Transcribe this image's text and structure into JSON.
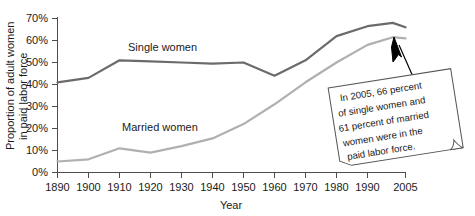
{
  "chart_data": {
    "type": "line",
    "title": "",
    "xlabel": "Year",
    "ylabel": "Proportion of adult women in paid labor force",
    "ylabel_line1": "Proportion of adult women",
    "ylabel_line2": "in paid labor force",
    "x": [
      1890,
      1900,
      1910,
      1920,
      1930,
      1940,
      1950,
      1960,
      1970,
      1980,
      1990,
      2000,
      2005
    ],
    "xticks": [
      "1890",
      "1900",
      "1910",
      "1920",
      "1930",
      "1940",
      "1950",
      "1960",
      "1970",
      "1980",
      "1990",
      "2005"
    ],
    "xtick_values": [
      1890,
      1900,
      1910,
      1920,
      1930,
      1940,
      1950,
      1960,
      1970,
      1980,
      1990,
      2005
    ],
    "yticks": [
      "0%",
      "10%",
      "20%",
      "30%",
      "40%",
      "50%",
      "60%",
      "70%"
    ],
    "ytick_values": [
      0,
      10,
      20,
      30,
      40,
      50,
      60,
      70
    ],
    "ylim": [
      0,
      70
    ],
    "xlim": [
      1890,
      2005
    ],
    "grid": false,
    "legend_position": "inline-labels",
    "series": [
      {
        "name": "Single women",
        "color": "#6b6b6b",
        "label_x": 1925,
        "label_y": 58,
        "values": [
          41,
          43,
          51,
          50.5,
          50,
          49.5,
          50,
          44,
          51,
          62,
          66.5,
          68,
          66
        ]
      },
      {
        "name": "Married women",
        "color": "#b0b0b0",
        "label_x": 1925,
        "label_y": 28,
        "values": [
          5,
          6,
          11,
          9,
          12,
          15.5,
          22,
          31,
          41,
          50,
          58,
          61.5,
          61
        ]
      }
    ],
    "annotation": {
      "lines": [
        "In 2005, 66 percent",
        "of single women and",
        "61 percent of married",
        "women were in the",
        "paid labor force."
      ],
      "full_text": "In 2005, 66 percent of single women and 61 percent of married women were in the paid labor force.",
      "rotation_deg": -9,
      "points_to_year": 2005
    }
  },
  "colors": {
    "single_women_line": "#6b6b6b",
    "married_women_line": "#b0b0b0",
    "axis": "#4d4d4d",
    "text": "#1a1a1a",
    "background": "#ffffff"
  }
}
